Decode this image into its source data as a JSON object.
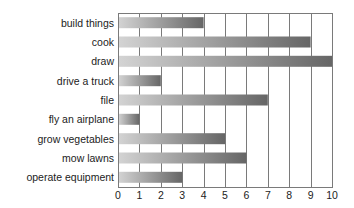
{
  "chart_data": {
    "type": "bar",
    "orientation": "horizontal",
    "title": "",
    "xlabel": "",
    "ylabel": "",
    "categories": [
      "build things",
      "cook",
      "draw",
      "drive a truck",
      "file",
      "fly an airplane",
      "grow vegetables",
      "mow lawns",
      "operate equipment"
    ],
    "values": [
      4,
      9,
      10,
      2,
      7,
      1,
      5,
      6,
      3
    ],
    "xlim": [
      0,
      10
    ],
    "xticks": [
      "0",
      "1",
      "2",
      "3",
      "4",
      "5",
      "6",
      "7",
      "8",
      "9",
      "10"
    ],
    "grid": true,
    "legend": "none",
    "colors": {
      "bar_gradient_start": "#d4d4d4",
      "bar_gradient_end": "#666666",
      "grid": "#7a7a7a",
      "text": "#222222"
    }
  }
}
